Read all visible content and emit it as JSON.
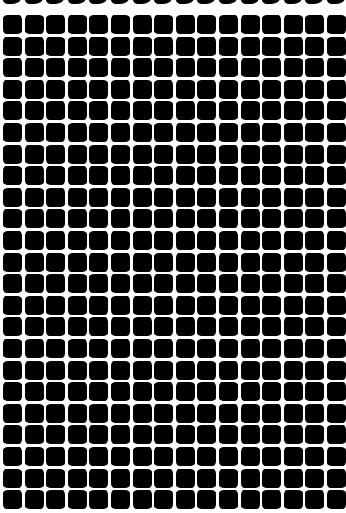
{
  "pattern": {
    "description": "Grid of black rounded squares with wavy white grout lines (optical illusion)",
    "columns": 16,
    "rows": 23,
    "pitch_px": 21.6,
    "tile_size_px": 19,
    "origin": [
      3,
      15
    ],
    "tile_color": "#000000",
    "background_color": "#ffffff",
    "top_strip_marks": 16
  }
}
